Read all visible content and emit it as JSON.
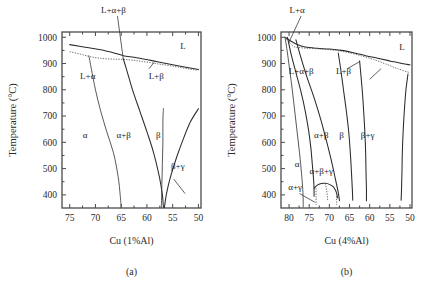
{
  "figure": {
    "background": "#ffffff",
    "line_color": "#2b2b2b",
    "text_color": "#1a1a1a"
  },
  "chart_data": [
    {
      "type": "line",
      "panel": "a",
      "caption": "(a)",
      "title": "",
      "xlabel": "Cu  (1%Al)",
      "ylabel": "Temperature (°C)",
      "xticks": [
        75,
        70,
        65,
        60,
        55,
        50
      ],
      "xticklabels": [
        "75",
        "70",
        "65",
        "60",
        "55",
        "50"
      ],
      "yticks": [
        1000,
        900,
        800,
        700,
        600,
        500,
        400
      ],
      "yticklabels": [
        "1000",
        "900",
        "800",
        "700",
        "600",
        "500",
        "400"
      ],
      "xlim": [
        76.5,
        49.5
      ],
      "ylim": [
        350,
        1020
      ],
      "x_reversed": true,
      "grid": false,
      "legend": null,
      "region_labels": [
        {
          "text": "L",
          "x": 53.0,
          "y": 955
        },
        {
          "text": "L+α",
          "x": 71.5,
          "y": 840
        },
        {
          "text": "L+β",
          "x": 58.2,
          "y": 840
        },
        {
          "text": "α",
          "x": 72.0,
          "y": 615
        },
        {
          "text": "α+β",
          "x": 64.5,
          "y": 615
        },
        {
          "text": "β",
          "x": 57.8,
          "y": 615
        },
        {
          "text": "β+γ",
          "x": 54.0,
          "y": 500
        }
      ],
      "annotations": [
        {
          "text": "L+α+β",
          "tx": 66.5,
          "ty": 1092,
          "px": 64.6,
          "py": 917
        }
      ],
      "series": [
        {
          "name": "liquidus",
          "style": "solid",
          "points": [
            [
              75,
              972
            ],
            [
              72,
              962
            ],
            [
              69,
              952
            ],
            [
              66,
              938
            ],
            [
              64.6,
              930
            ],
            [
              62,
              922
            ],
            [
              59,
              911
            ],
            [
              56,
              899
            ],
            [
              53,
              888
            ],
            [
              50,
              877
            ]
          ]
        },
        {
          "name": "solidus-dotted",
          "style": "dotted",
          "points": [
            [
              75,
              945
            ],
            [
              73,
              936
            ],
            [
              71,
              926
            ],
            [
              69,
              920
            ],
            [
              67,
              917
            ],
            [
              65,
              916
            ],
            [
              63,
              913
            ],
            [
              61,
              908
            ],
            [
              58,
              899
            ],
            [
              55,
              890
            ],
            [
              52,
              880
            ],
            [
              50,
              874
            ]
          ]
        },
        {
          "name": "alpha-solvus",
          "style": "thin",
          "points": [
            [
              71.3,
              931
            ],
            [
              70.8,
              880
            ],
            [
              70.0,
              800
            ],
            [
              69.0,
              720
            ],
            [
              67.8,
              640
            ],
            [
              66.5,
              560
            ],
            [
              65.6,
              470
            ],
            [
              65.2,
              400
            ],
            [
              65.0,
              352
            ]
          ]
        },
        {
          "name": "alpha-beta-boundary",
          "style": "solid",
          "points": [
            [
              64.6,
              918
            ],
            [
              64.0,
              880
            ],
            [
              62.8,
              800
            ],
            [
              61.4,
              720
            ],
            [
              60.0,
              640
            ],
            [
              58.7,
              560
            ],
            [
              57.6,
              470
            ],
            [
              57.0,
              400
            ],
            [
              56.8,
              352
            ]
          ]
        },
        {
          "name": "beta-gamma-boundary",
          "style": "thin",
          "points": [
            [
              57.2,
              352
            ],
            [
              57.1,
              440
            ],
            [
              57.0,
              520
            ],
            [
              56.9,
              600
            ],
            [
              56.9,
              680
            ],
            [
              56.8,
              730
            ]
          ]
        },
        {
          "name": "gamma-boundary-right",
          "style": "solid",
          "points": [
            [
              50.0,
              728
            ],
            [
              51.5,
              680
            ],
            [
              52.8,
              620
            ],
            [
              54.2,
              545
            ],
            [
              55.4,
              470
            ],
            [
              56.2,
              405
            ],
            [
              56.6,
              352
            ]
          ]
        }
      ]
    },
    {
      "type": "line",
      "panel": "b",
      "caption": "(b)",
      "title": "",
      "xlabel": "Cu  (4%Al)",
      "ylabel": "Temperature (°C)",
      "xticks": [
        80,
        75,
        70,
        65,
        60,
        55,
        50
      ],
      "xticklabels": [
        "80",
        "75",
        "70",
        "65",
        "60",
        "55",
        "50"
      ],
      "yticks": [
        1000,
        900,
        800,
        700,
        600,
        500,
        400
      ],
      "yticklabels": [
        "1000",
        "900",
        "800",
        "700",
        "600",
        "500",
        "400"
      ],
      "xlim": [
        82.0,
        49.5
      ],
      "ylim": [
        350,
        1020
      ],
      "x_reversed": true,
      "grid": false,
      "legend": null,
      "region_labels": [
        {
          "text": "L",
          "x": 52.0,
          "y": 950
        },
        {
          "text": "L+α+β",
          "x": 77.0,
          "y": 862
        },
        {
          "text": "L+β",
          "x": 66.5,
          "y": 862
        },
        {
          "text": "α",
          "x": 78.0,
          "y": 505
        },
        {
          "text": "α+β",
          "x": 72.0,
          "y": 615
        },
        {
          "text": "β",
          "x": 67.0,
          "y": 615
        },
        {
          "text": "β+γ",
          "x": 60.5,
          "y": 615
        },
        {
          "text": "α+β+γ",
          "x": 72.0,
          "y": 480
        },
        {
          "text": "α+γ",
          "x": 78.5,
          "y": 420
        }
      ],
      "annotations": [
        {
          "text": "L+α",
          "tx": 78.0,
          "ty": 1092,
          "px": 80.2,
          "py": 975
        }
      ],
      "series": [
        {
          "name": "liquidus",
          "style": "solid",
          "points": [
            [
              81.0,
              1000
            ],
            [
              79.5,
              985
            ],
            [
              78.0,
              972
            ],
            [
              76.0,
              963
            ],
            [
              73.0,
              958
            ],
            [
              70.0,
              955
            ],
            [
              67.0,
              950
            ],
            [
              64.0,
              941
            ],
            [
              61.0,
              930
            ],
            [
              58.0,
              920
            ],
            [
              55.0,
              910
            ],
            [
              52.0,
              900
            ],
            [
              50.0,
              895
            ]
          ]
        },
        {
          "name": "solidus-dotted",
          "style": "dotted",
          "points": [
            [
              81.0,
              1000
            ],
            [
              79.0,
              966
            ],
            [
              77.0,
              960
            ],
            [
              74.0,
              957
            ],
            [
              71.0,
              954
            ],
            [
              68.0,
              949
            ],
            [
              65.0,
              941
            ],
            [
              62.0,
              929
            ],
            [
              59.0,
              915
            ],
            [
              56.0,
              898
            ],
            [
              53.0,
              880
            ],
            [
              50.0,
              865
            ]
          ]
        },
        {
          "name": "alpha-left-solvus",
          "style": "thin",
          "points": [
            [
              81.0,
              1000
            ],
            [
              80.4,
              940
            ],
            [
              79.8,
              870
            ],
            [
              79.2,
              800
            ],
            [
              78.6,
              720
            ],
            [
              78.0,
              640
            ],
            [
              77.4,
              560
            ],
            [
              76.9,
              480
            ],
            [
              76.6,
              420
            ],
            [
              76.5,
              380
            ],
            [
              76.5,
              352
            ]
          ]
        },
        {
          "name": "alpha-boundary-inner",
          "style": "solid",
          "points": [
            [
              80.4,
              1000
            ],
            [
              79.4,
              930
            ],
            [
              78.2,
              860
            ],
            [
              77.0,
              790
            ],
            [
              76.0,
              720
            ],
            [
              75.2,
              650
            ],
            [
              74.6,
              580
            ],
            [
              74.2,
              510
            ],
            [
              73.9,
              455
            ],
            [
              73.8,
              420
            ],
            [
              73.8,
              395
            ]
          ]
        },
        {
          "name": "alpha-beta-boundary",
          "style": "solid",
          "points": [
            [
              78.3,
              990
            ],
            [
              77.2,
              930
            ],
            [
              75.6,
              850
            ],
            [
              73.8,
              770
            ],
            [
              72.2,
              690
            ],
            [
              70.8,
              610
            ],
            [
              69.5,
              530
            ],
            [
              68.5,
              460
            ],
            [
              67.8,
              410
            ],
            [
              67.5,
              378
            ]
          ]
        },
        {
          "name": "beta-left",
          "style": "solid",
          "points": [
            [
              67.8,
              940
            ],
            [
              67.2,
              880
            ],
            [
              66.5,
              800
            ],
            [
              65.8,
              720
            ],
            [
              65.2,
              640
            ],
            [
              64.8,
              560
            ],
            [
              64.5,
              480
            ],
            [
              64.3,
              420
            ],
            [
              64.2,
              380
            ]
          ]
        },
        {
          "name": "beta-gamma-left",
          "style": "solid",
          "points": [
            [
              62.5,
              910
            ],
            [
              62.2,
              860
            ],
            [
              61.8,
              790
            ],
            [
              61.5,
              720
            ],
            [
              61.2,
              640
            ],
            [
              61.0,
              560
            ],
            [
              60.9,
              480
            ],
            [
              60.8,
              420
            ],
            [
              60.8,
              378
            ]
          ]
        },
        {
          "name": "gamma-right",
          "style": "solid",
          "points": [
            [
              50.5,
              860
            ],
            [
              51.0,
              800
            ],
            [
              51.4,
              720
            ],
            [
              51.7,
              640
            ],
            [
              51.9,
              560
            ],
            [
              52.0,
              480
            ],
            [
              52.1,
              420
            ],
            [
              52.2,
              380
            ]
          ]
        },
        {
          "name": "eutectoid-arc",
          "style": "solid",
          "points": [
            [
              73.8,
              425
            ],
            [
              73.0,
              437
            ],
            [
              72.0,
              443
            ],
            [
              71.0,
              444
            ],
            [
              70.0,
              440
            ],
            [
              69.0,
              430
            ],
            [
              68.4,
              415
            ],
            [
              68.1,
              400
            ],
            [
              68.0,
              388
            ]
          ]
        },
        {
          "name": "alpha-gamma-dotted-1",
          "style": "dotted",
          "points": [
            [
              73.3,
              425
            ],
            [
              73.3,
              390
            ],
            [
              73.3,
              362
            ]
          ]
        },
        {
          "name": "alpha-gamma-dotted-2",
          "style": "dotted",
          "points": [
            [
              68.2,
              405
            ],
            [
              68.2,
              380
            ],
            [
              68.2,
              362
            ]
          ]
        },
        {
          "name": "alpha-gamma-dotted-3",
          "style": "dotted",
          "points": [
            [
              71.0,
              444
            ],
            [
              70.6,
              410
            ],
            [
              70.4,
              375
            ]
          ]
        }
      ]
    }
  ]
}
